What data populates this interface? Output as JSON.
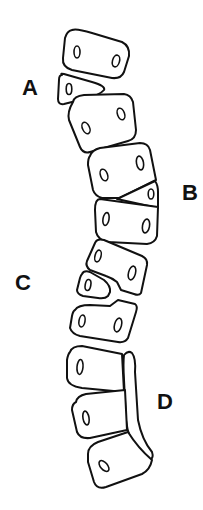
{
  "diagram": {
    "type": "segmented column of blocks",
    "colors": {
      "stroke": "#111111",
      "background": "#ffffff"
    },
    "labels": [
      {
        "id": "A",
        "text": "A"
      },
      {
        "id": "B",
        "text": "B"
      },
      {
        "id": "C",
        "text": "C"
      },
      {
        "id": "D",
        "text": "D"
      }
    ],
    "block_count": 11
  }
}
